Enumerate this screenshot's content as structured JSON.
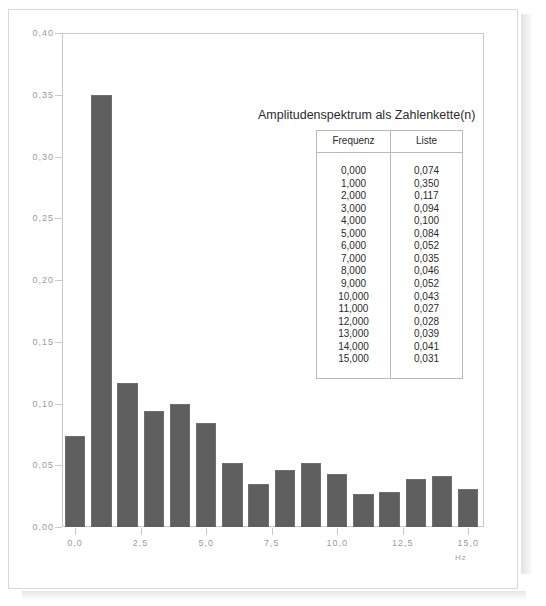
{
  "overlay": {
    "title": "Amplitudenspektrum als Zahlenkette(n)",
    "table": {
      "headers": [
        "Frequenz",
        "Liste"
      ],
      "rows": [
        [
          "0,000",
          "0,074"
        ],
        [
          "1,000",
          "0,350"
        ],
        [
          "2,000",
          "0,117"
        ],
        [
          "3,000",
          "0,094"
        ],
        [
          "4,000",
          "0,100"
        ],
        [
          "5,000",
          "0,084"
        ],
        [
          "6,000",
          "0,052"
        ],
        [
          "7,000",
          "0,035"
        ],
        [
          "8,000",
          "0,046"
        ],
        [
          "9,000",
          "0,052"
        ],
        [
          "10,000",
          "0,043"
        ],
        [
          "11,000",
          "0,027"
        ],
        [
          "12,000",
          "0,028"
        ],
        [
          "13,000",
          "0,039"
        ],
        [
          "14,000",
          "0,041"
        ],
        [
          "15,000",
          "0,031"
        ]
      ]
    }
  },
  "axes": {
    "y_tick_labels": [
      "0,40",
      "0,35",
      "0,30",
      "0,25",
      "0,20",
      "0,15",
      "0,10",
      "0,05",
      "0,00"
    ],
    "x_tick_labels": [
      "0,0",
      "2,5",
      "5,0",
      "7,5",
      "10,0",
      "12,5",
      "15,0"
    ],
    "x_unit": "Hz"
  },
  "colors": {
    "bar_fill": "#5f5f5f",
    "bar_edge": "#6e6e6e",
    "axis": "#c9c9c9",
    "tick_text": "#9a9a9a",
    "overlay_text": "#2b2b2b",
    "table_border": "#b9b9b9",
    "page_border": "#d8d8d8"
  },
  "chart_data": {
    "type": "bar",
    "title": "Amplitudenspektrum als Zahlenkette(n)",
    "xlabel": "Hz",
    "ylabel": "",
    "x": [
      0,
      1,
      2,
      3,
      4,
      5,
      6,
      7,
      8,
      9,
      10,
      11,
      12,
      13,
      14,
      15
    ],
    "categories": [
      "0,000",
      "1,000",
      "2,000",
      "3,000",
      "4,000",
      "5,000",
      "6,000",
      "7,000",
      "8,000",
      "9,000",
      "10,000",
      "11,000",
      "12,000",
      "13,000",
      "14,000",
      "15,000"
    ],
    "values": [
      0.074,
      0.35,
      0.117,
      0.094,
      0.1,
      0.084,
      0.052,
      0.035,
      0.046,
      0.052,
      0.043,
      0.027,
      0.028,
      0.039,
      0.041,
      0.031
    ],
    "xlim": [
      -0.5,
      15.6
    ],
    "ylim": [
      0.0,
      0.4
    ],
    "y_ticks": [
      0.0,
      0.05,
      0.1,
      0.15,
      0.2,
      0.25,
      0.3,
      0.35,
      0.4
    ],
    "x_ticks": [
      0.0,
      2.5,
      5.0,
      7.5,
      10.0,
      12.5,
      15.0
    ],
    "grid": false,
    "legend": false
  }
}
